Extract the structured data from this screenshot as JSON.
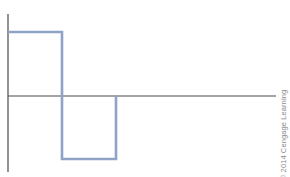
{
  "figure": {
    "credit": "© 2014 Cengage Learning",
    "colors": {
      "axis": "#4a4a4a",
      "waveform": "#8ea3c6",
      "credit_text": "#8a8a8a"
    },
    "axes": {
      "y_axis": {
        "x": 8,
        "y_top": 14,
        "y_bottom": 172
      },
      "x_axis": {
        "y": 96,
        "x_start": 8,
        "x_end": 276
      }
    },
    "waveform_points": [
      [
        8,
        32
      ],
      [
        62,
        32
      ],
      [
        62,
        159
      ],
      [
        116,
        159
      ],
      [
        116,
        96
      ]
    ]
  }
}
